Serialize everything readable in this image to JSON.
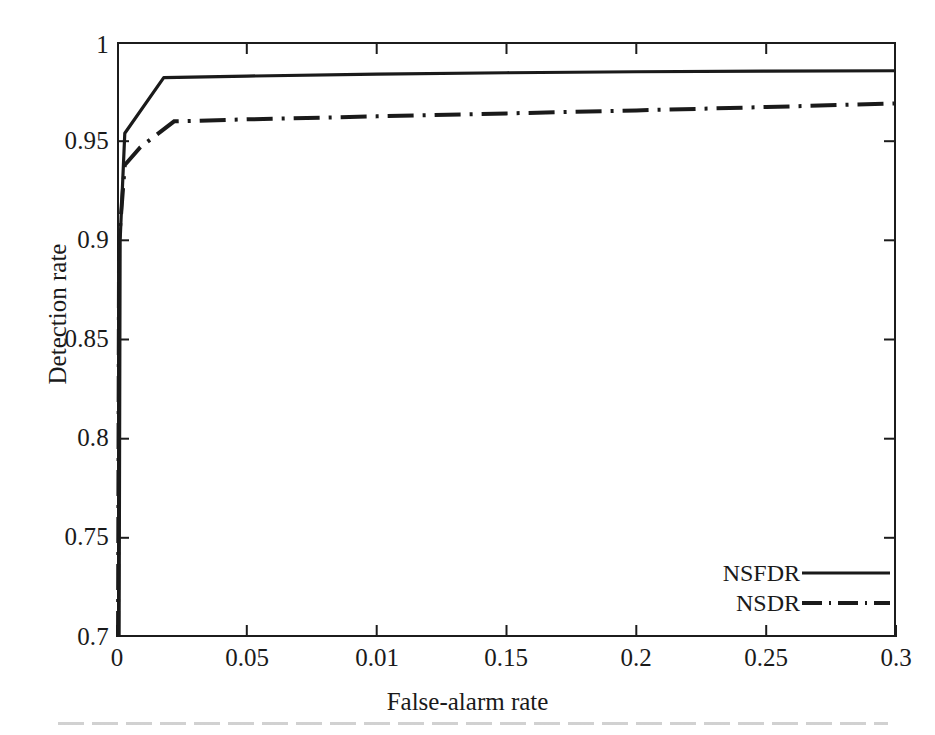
{
  "chart_data": {
    "type": "line",
    "title": "",
    "xlabel": "False-alarm rate",
    "ylabel": "Detection rate",
    "xlim": [
      0,
      0.3
    ],
    "ylim": [
      0.7,
      1
    ],
    "grid": false,
    "legend_position": "bottom-right",
    "xticks": [
      0,
      0.05,
      0.1,
      0.15,
      0.2,
      0.25,
      0.3
    ],
    "xtick_labels": [
      "0",
      "0.05",
      "0.01",
      "0.15",
      "0.2",
      "0.25",
      "0.3"
    ],
    "yticks": [
      0.7,
      0.75,
      0.8,
      0.85,
      0.9,
      0.95,
      1
    ],
    "ytick_labels": [
      "0.7",
      "0.75",
      "0.8",
      "0.85",
      "0.9",
      "0.95",
      "1"
    ],
    "series": [
      {
        "name": "NSFDR",
        "style": "solid",
        "color": "#1a1a1a",
        "x": [
          0.0008,
          0.0012,
          0.003,
          0.018,
          0.05,
          0.1,
          0.15,
          0.2,
          0.25,
          0.3
        ],
        "y": [
          0.7,
          0.9,
          0.954,
          0.982,
          0.9828,
          0.9838,
          0.9845,
          0.985,
          0.9853,
          0.9855
        ]
      },
      {
        "name": "NSDR",
        "style": "dash-dot",
        "color": "#1a1a1a",
        "x": [
          0.0004,
          0.0008,
          0.003,
          0.009,
          0.022,
          0.05,
          0.1,
          0.15,
          0.2,
          0.25,
          0.3
        ],
        "y": [
          0.7,
          0.9,
          0.938,
          0.947,
          0.96,
          0.961,
          0.9625,
          0.964,
          0.9655,
          0.9672,
          0.969
        ]
      }
    ]
  },
  "legend": {
    "items": [
      {
        "label": "NSFDR",
        "style": "solid"
      },
      {
        "label": "NSDR",
        "style": "dash-dot"
      }
    ]
  },
  "axes": {
    "x_title": "False-alarm rate",
    "y_title": "Detection rate"
  }
}
